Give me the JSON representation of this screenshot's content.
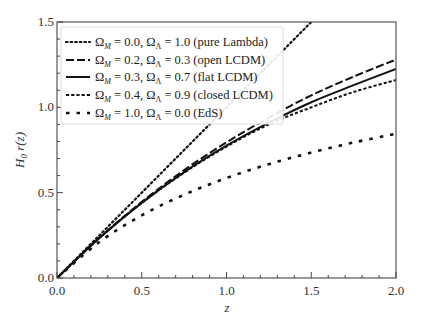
{
  "chart_data": {
    "type": "line",
    "title": "",
    "xlabel": "z",
    "ylabel": "H0 r(z)",
    "xlim": [
      0.0,
      2.0
    ],
    "ylim": [
      0.0,
      1.5
    ],
    "grid": false,
    "legend_position": "upper left",
    "xticks": [
      "0.0",
      "0.5",
      "1.0",
      "1.5",
      "2.0"
    ],
    "yticks": [
      "0.0",
      "0.5",
      "1.0",
      "1.5"
    ],
    "x": [
      0.0,
      0.25,
      0.5,
      0.75,
      1.0,
      1.25,
      1.5,
      1.75,
      2.0
    ],
    "series": [
      {
        "name": "Ω_M = 0.0, Ω_Λ = 1.0 (pure Lambda)",
        "style": "dotted",
        "values": [
          0.0,
          0.25,
          0.5,
          0.75,
          1.0,
          1.25,
          1.5,
          1.75,
          2.0
        ]
      },
      {
        "name": "Ω_M = 0.2, Ω_Λ = 0.3 (open LCDM)",
        "style": "long-dash",
        "values": [
          0.0,
          0.236,
          0.446,
          0.632,
          0.795,
          0.94,
          1.07,
          1.18,
          1.28
        ]
      },
      {
        "name": "Ω_M = 0.3, Ω_Λ = 0.7 (flat LCDM)",
        "style": "solid",
        "values": [
          0.0,
          0.234,
          0.44,
          0.62,
          0.775,
          0.91,
          1.03,
          1.13,
          1.225
        ]
      },
      {
        "name": "Ω_M = 0.4, Ω_Λ = 0.9 (closed LCDM)",
        "style": "short-dash",
        "values": [
          0.0,
          0.234,
          0.44,
          0.617,
          0.77,
          0.9,
          1.0,
          1.09,
          1.16
        ]
      },
      {
        "name": "Ω_M = 1.0, Ω_Λ = 0.0 (EdS)",
        "style": "sparse-dash",
        "values": [
          0.0,
          0.211,
          0.367,
          0.488,
          0.586,
          0.667,
          0.735,
          0.794,
          0.845
        ]
      }
    ]
  },
  "legend": [
    {
      "om": "0.0",
      "ol": "1.0",
      "desc": "(pure Lambda)"
    },
    {
      "om": "0.2",
      "ol": "0.3",
      "desc": "(open LCDM)"
    },
    {
      "om": "0.3",
      "ol": "0.7",
      "desc": "(flat LCDM)"
    },
    {
      "om": "0.4",
      "ol": "0.9",
      "desc": "(closed LCDM)"
    },
    {
      "om": "1.0",
      "ol": "0.0",
      "desc": "(EdS)"
    }
  ],
  "axes": {
    "xlabel": "z",
    "ylabel_main": "H",
    "ylabel_sub": "0",
    "ylabel_rest": " r(z)"
  }
}
